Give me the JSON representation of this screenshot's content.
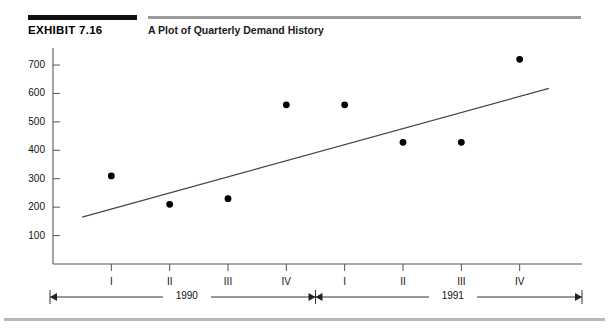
{
  "header": {
    "exhibit_label": "EXHIBIT 7.16",
    "title": "A Plot of Quarterly Demand History",
    "rule_color_dark": "#111111",
    "rule_color_light": "#9a9a9a"
  },
  "chart_data": {
    "type": "scatter",
    "title": "A Plot of Quarterly Demand History",
    "xlabel": "",
    "ylabel": "",
    "grid": false,
    "legend": null,
    "ylim": [
      0,
      760
    ],
    "ytick_labels": [
      "100",
      "200",
      "300",
      "400",
      "500",
      "600",
      "700"
    ],
    "ytick_values": [
      100,
      200,
      300,
      400,
      500,
      600,
      700
    ],
    "xtick_labels": [
      "I",
      "II",
      "III",
      "IV",
      "I",
      "II",
      "III",
      "IV"
    ],
    "x": [
      1,
      2,
      3,
      4,
      5,
      6,
      7,
      8
    ],
    "values": [
      310,
      210,
      230,
      560,
      560,
      428,
      428,
      720
    ],
    "point_color": "#000000",
    "series": [
      {
        "name": "Quarterly demand",
        "values": [
          310,
          210,
          230,
          560,
          560,
          428,
          428,
          720
        ]
      }
    ],
    "trend_line": {
      "name": "Linear trend",
      "x_start": 0.5,
      "x_end": 8.5,
      "y_start": 165,
      "y_end": 618,
      "color": "#444444"
    },
    "group_axis": {
      "label_left": "1990",
      "label_right": "1991",
      "split_at": 4.5
    }
  },
  "axis": {
    "line_color": "#555555"
  }
}
